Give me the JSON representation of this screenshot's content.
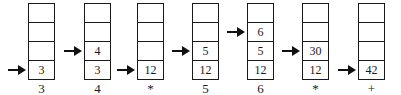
{
  "figure": {
    "background_color": "#ffffff",
    "line_color": "#1a1a1a",
    "stacks": [
      {
        "cells": [
          "",
          "",
          "",
          "3"
        ],
        "pointer_row": "3",
        "label": "3"
      },
      {
        "cells": [
          "",
          "",
          "4",
          "3"
        ],
        "pointer_row": "2",
        "label": "4"
      },
      {
        "cells": [
          "",
          "",
          "",
          "12"
        ],
        "pointer_row": "3",
        "label": "*"
      },
      {
        "cells": [
          "",
          "",
          "5",
          "12"
        ],
        "pointer_row": "2",
        "label": "5"
      },
      {
        "cells": [
          "",
          "6",
          "5",
          "12"
        ],
        "pointer_row": "1",
        "label": "6"
      },
      {
        "cells": [
          "",
          "",
          "30",
          "12"
        ],
        "pointer_row": "2",
        "label": "*"
      },
      {
        "cells": [
          "",
          "",
          "",
          "42"
        ],
        "pointer_row": "3",
        "label": "+"
      }
    ]
  }
}
